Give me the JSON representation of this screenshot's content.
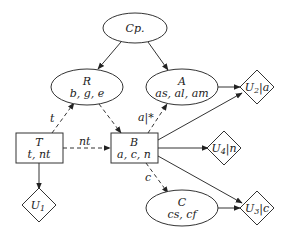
{
  "diagram": {
    "nodes": {
      "cp": {
        "shape": "ellipse",
        "title": "Cp.",
        "attrs": ""
      },
      "r": {
        "shape": "ellipse",
        "title": "R",
        "attrs": "b, g, e"
      },
      "a": {
        "shape": "ellipse",
        "title": "A",
        "attrs": "as, al, am"
      },
      "c": {
        "shape": "ellipse",
        "title": "C",
        "attrs": "cs, cf"
      },
      "t": {
        "shape": "rectangle",
        "title": "T",
        "attrs": "t, nt"
      },
      "b": {
        "shape": "rectangle",
        "title": "B",
        "attrs": "a, c, n"
      },
      "u1": {
        "shape": "diamond",
        "main": "U",
        "sub": "1",
        "suffix": ""
      },
      "u2": {
        "shape": "diamond",
        "main": "U",
        "sub": "2",
        "suffix": "|a"
      },
      "u3": {
        "shape": "diamond",
        "main": "U",
        "sub": "3",
        "suffix": "|c"
      },
      "u4": {
        "shape": "diamond",
        "main": "U",
        "sub": "4",
        "suffix": "|n"
      }
    },
    "edges": [
      {
        "from": "Cp.",
        "to": "R",
        "style": "solid",
        "label": ""
      },
      {
        "from": "Cp.",
        "to": "A",
        "style": "solid",
        "label": ""
      },
      {
        "from": "A",
        "to": "U2|a",
        "style": "solid",
        "label": ""
      },
      {
        "from": "T",
        "to": "R",
        "style": "dashed",
        "label": "t"
      },
      {
        "from": "R",
        "to": "B",
        "style": "dashed",
        "label": ""
      },
      {
        "from": "B",
        "to": "A",
        "style": "dashed",
        "label": "a|*"
      },
      {
        "from": "T",
        "to": "B",
        "style": "dashed",
        "label": "nt"
      },
      {
        "from": "B",
        "to": "U2|a",
        "style": "solid",
        "label": ""
      },
      {
        "from": "B",
        "to": "U4|n",
        "style": "solid",
        "label": ""
      },
      {
        "from": "B",
        "to": "U3|c",
        "style": "solid",
        "label": ""
      },
      {
        "from": "B",
        "to": "C",
        "style": "dashed",
        "label": "c"
      },
      {
        "from": "C",
        "to": "U3|c",
        "style": "solid",
        "label": ""
      },
      {
        "from": "T",
        "to": "U1",
        "style": "solid",
        "label": ""
      }
    ],
    "edge_labels": {
      "t": "t",
      "nt": "nt",
      "a": "a|*",
      "c": "c"
    }
  }
}
